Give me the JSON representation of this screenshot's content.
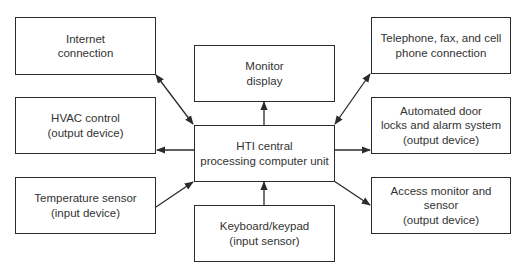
{
  "diagram": {
    "type": "block-diagram",
    "center": {
      "id": "hti-cpu",
      "lines": [
        "HTI central",
        "processing computer unit"
      ]
    },
    "nodes": [
      {
        "id": "internet",
        "lines": [
          "Internet",
          "connection"
        ]
      },
      {
        "id": "hvac",
        "lines": [
          "HVAC control",
          "(output device)"
        ]
      },
      {
        "id": "temperature",
        "lines": [
          "Temperature sensor",
          "(input device)"
        ]
      },
      {
        "id": "monitor",
        "lines": [
          "Monitor",
          "display"
        ]
      },
      {
        "id": "keyboard",
        "lines": [
          "Keyboard/keypad",
          "(input sensor)"
        ]
      },
      {
        "id": "telephone",
        "lines": [
          "Telephone, fax, and cell",
          "phone connection"
        ]
      },
      {
        "id": "doorlocks",
        "lines": [
          "Automated door",
          "locks and alarm system",
          "(output device)"
        ]
      },
      {
        "id": "access",
        "lines": [
          "Access monitor and sensor",
          "(output device)"
        ]
      }
    ],
    "edges": [
      {
        "from": "internet",
        "to": "hti-cpu",
        "direction": "bidirectional"
      },
      {
        "from": "hti-cpu",
        "to": "hvac",
        "direction": "one-way"
      },
      {
        "from": "temperature",
        "to": "hti-cpu",
        "direction": "one-way"
      },
      {
        "from": "hti-cpu",
        "to": "monitor",
        "direction": "one-way"
      },
      {
        "from": "keyboard",
        "to": "hti-cpu",
        "direction": "one-way"
      },
      {
        "from": "telephone",
        "to": "hti-cpu",
        "direction": "bidirectional"
      },
      {
        "from": "hti-cpu",
        "to": "doorlocks",
        "direction": "one-way"
      },
      {
        "from": "hti-cpu",
        "to": "access",
        "direction": "one-way"
      }
    ],
    "colors": {
      "stroke": "#2b2b2b",
      "text": "#333333",
      "background": "#ffffff"
    }
  }
}
